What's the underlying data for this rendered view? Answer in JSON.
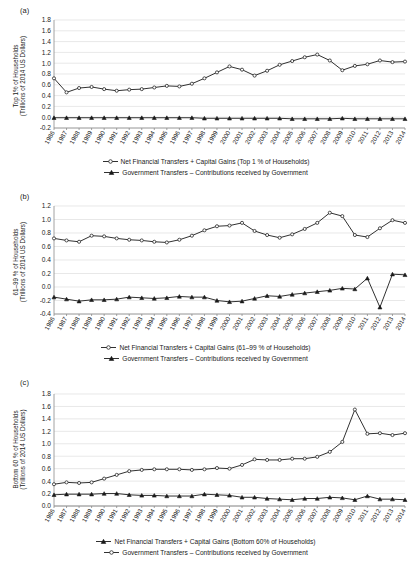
{
  "figure": {
    "years": [
      "1986",
      "1987",
      "1988",
      "1989",
      "1990",
      "1991",
      "1992",
      "1993",
      "1994",
      "1995",
      "1996",
      "1997",
      "1998",
      "1999",
      "2000",
      "2001",
      "2002",
      "2003",
      "2004",
      "2005",
      "2006",
      "2007",
      "2008",
      "2009",
      "2010",
      "2011",
      "2012",
      "2013",
      "2014"
    ],
    "ink_color": "#1a1a1a",
    "grid_color": "#d9d9d9"
  },
  "panels": {
    "a": {
      "tag": "(a)",
      "ylabel_line1": "Top 1% of Households",
      "ylabel_line2": "(Trillions of 2014 US Dollars)",
      "yticks": [
        "-0.2",
        "0.0",
        "0.2",
        "0.4",
        "0.6",
        "0.8",
        "1.0",
        "1.2",
        "1.4",
        "1.6",
        "1.8"
      ],
      "legend": [
        {
          "label": "Net Financial Transfers + Capital Gains (Top 1 % of Households)",
          "marker": "open-circle"
        },
        {
          "label": "Government Transfers – Contributions received by Government",
          "marker": "filled-triangle"
        }
      ]
    },
    "b": {
      "tag": "(b)",
      "ylabel_line1": "61–99 % of Households",
      "ylabel_line2": "(Trillions of 2014  US Dollars)",
      "yticks": [
        "-0.4",
        "-0.2",
        "0.0",
        "0.2",
        "0.4",
        "0.6",
        "0.8",
        "1.0",
        "1.2"
      ],
      "legend": [
        {
          "label": "Net Financial Transfers + Capital Gains (61–99 % of Households)",
          "marker": "open-circle"
        },
        {
          "label": "Government Transfers – Contributions received by Government",
          "marker": "filled-triangle"
        }
      ]
    },
    "c": {
      "tag": "(c)",
      "ylabel_line1": "Bottom 60 % of Households",
      "ylabel_line2": "(Trillions of 2014 US Dollars)",
      "yticks": [
        "0.0",
        "0.2",
        "0.4",
        "0.6",
        "0.8",
        "1.0",
        "1.2",
        "1.4",
        "1.6",
        "1.8"
      ],
      "legend": [
        {
          "label": "Net Financial Transfers + Capital Gains (Bottom 60% of Households)",
          "marker": "filled-triangle"
        },
        {
          "label": "Government Transfers – Contributions received by Government",
          "marker": "open-circle"
        }
      ]
    }
  },
  "chart_data": [
    {
      "type": "line",
      "panel": "a",
      "title": "(a) Top 1% of Households",
      "xlabel": "",
      "ylabel": "Top 1% of Households (Trillions of 2014 US Dollars)",
      "ylim": [
        -0.2,
        1.8
      ],
      "ytick_step": 0.2,
      "grid": true,
      "legend_position": "below",
      "x": [
        "1986",
        "1987",
        "1988",
        "1989",
        "1990",
        "1991",
        "1992",
        "1993",
        "1994",
        "1995",
        "1996",
        "1997",
        "1998",
        "1999",
        "2000",
        "2001",
        "2002",
        "2003",
        "2004",
        "2005",
        "2006",
        "2007",
        "2008",
        "2009",
        "2010",
        "2011",
        "2012",
        "2013",
        "2014"
      ],
      "series": [
        {
          "name": "Net Financial Transfers + Capital Gains (Top 1 % of Households)",
          "marker": "open-circle",
          "values": [
            0.72,
            0.46,
            0.54,
            0.56,
            0.52,
            0.49,
            0.51,
            0.52,
            0.55,
            0.58,
            0.57,
            0.62,
            0.72,
            0.83,
            0.94,
            0.88,
            0.77,
            0.86,
            0.97,
            1.04,
            1.11,
            1.16,
            1.05,
            0.87,
            0.95,
            0.98,
            1.05,
            1.02,
            1.03
          ]
        },
        {
          "name": "Government Transfers – Contributions received by Government",
          "marker": "filled-triangle",
          "values": [
            -0.01,
            -0.01,
            -0.01,
            -0.01,
            -0.01,
            -0.01,
            -0.01,
            -0.01,
            -0.01,
            -0.01,
            -0.01,
            -0.01,
            -0.02,
            -0.02,
            -0.02,
            -0.02,
            -0.02,
            -0.02,
            -0.02,
            -0.03,
            -0.03,
            -0.03,
            -0.03,
            -0.02,
            -0.03,
            -0.03,
            -0.03,
            -0.03,
            -0.03
          ]
        }
      ]
    },
    {
      "type": "line",
      "panel": "b",
      "title": "(b) 61–99 % of Households",
      "xlabel": "",
      "ylabel": "61–99 % of Households (Trillions of 2014 US Dollars)",
      "ylim": [
        -0.4,
        1.2
      ],
      "ytick_step": 0.2,
      "grid": true,
      "legend_position": "below",
      "x": [
        "1986",
        "1987",
        "1988",
        "1989",
        "1990",
        "1991",
        "1992",
        "1993",
        "1994",
        "1995",
        "1996",
        "1997",
        "1998",
        "1999",
        "2000",
        "2001",
        "2002",
        "2003",
        "2004",
        "2005",
        "2006",
        "2007",
        "2008",
        "2009",
        "2010",
        "2011",
        "2012",
        "2013",
        "2014"
      ],
      "series": [
        {
          "name": "Net Financial Transfers + Capital Gains (61–99 % of Households)",
          "marker": "open-circle",
          "values": [
            0.72,
            0.69,
            0.67,
            0.76,
            0.75,
            0.72,
            0.7,
            0.69,
            0.67,
            0.66,
            0.7,
            0.76,
            0.84,
            0.9,
            0.91,
            0.95,
            0.83,
            0.77,
            0.73,
            0.78,
            0.86,
            0.95,
            1.1,
            1.05,
            0.77,
            0.74,
            0.87,
            0.99,
            0.95
          ]
        },
        {
          "name": "Government Transfers – Contributions received by Government",
          "marker": "filled-triangle",
          "values": [
            -0.15,
            -0.18,
            -0.21,
            -0.19,
            -0.19,
            -0.18,
            -0.15,
            -0.16,
            -0.17,
            -0.16,
            -0.14,
            -0.15,
            -0.15,
            -0.2,
            -0.22,
            -0.21,
            -0.17,
            -0.13,
            -0.14,
            -0.11,
            -0.09,
            -0.07,
            -0.05,
            -0.02,
            -0.03,
            0.13,
            -0.3,
            0.19,
            0.18
          ]
        }
      ]
    },
    {
      "type": "line",
      "panel": "c",
      "title": "(c) Bottom 60 % of Households",
      "xlabel": "",
      "ylabel": "Bottom 60 % of Households (Trillions of 2014 US Dollars)",
      "ylim": [
        0.0,
        1.8
      ],
      "ytick_step": 0.2,
      "grid": true,
      "legend_position": "below",
      "x": [
        "1986",
        "1987",
        "1988",
        "1989",
        "1990",
        "1991",
        "1992",
        "1993",
        "1994",
        "1995",
        "1996",
        "1997",
        "1998",
        "1999",
        "2000",
        "2001",
        "2002",
        "2003",
        "2004",
        "2005",
        "2006",
        "2007",
        "2008",
        "2009",
        "2010",
        "2011",
        "2012",
        "2013",
        "2014"
      ],
      "series": [
        {
          "name": "Government Transfers – Contributions received by Government",
          "marker": "open-circle",
          "values": [
            0.35,
            0.38,
            0.37,
            0.38,
            0.44,
            0.5,
            0.56,
            0.58,
            0.59,
            0.59,
            0.59,
            0.58,
            0.59,
            0.61,
            0.6,
            0.66,
            0.75,
            0.74,
            0.74,
            0.76,
            0.76,
            0.79,
            0.87,
            1.03,
            1.55,
            1.16,
            1.17,
            1.14,
            1.17
          ]
        },
        {
          "name": "Net Financial Transfers + Capital Gains (Bottom 60% of Households)",
          "marker": "filled-triangle",
          "values": [
            0.18,
            0.19,
            0.19,
            0.19,
            0.2,
            0.2,
            0.18,
            0.17,
            0.17,
            0.16,
            0.16,
            0.16,
            0.19,
            0.18,
            0.17,
            0.14,
            0.14,
            0.12,
            0.11,
            0.1,
            0.12,
            0.12,
            0.14,
            0.13,
            0.1,
            0.16,
            0.11,
            0.11,
            0.1
          ]
        }
      ]
    }
  ]
}
